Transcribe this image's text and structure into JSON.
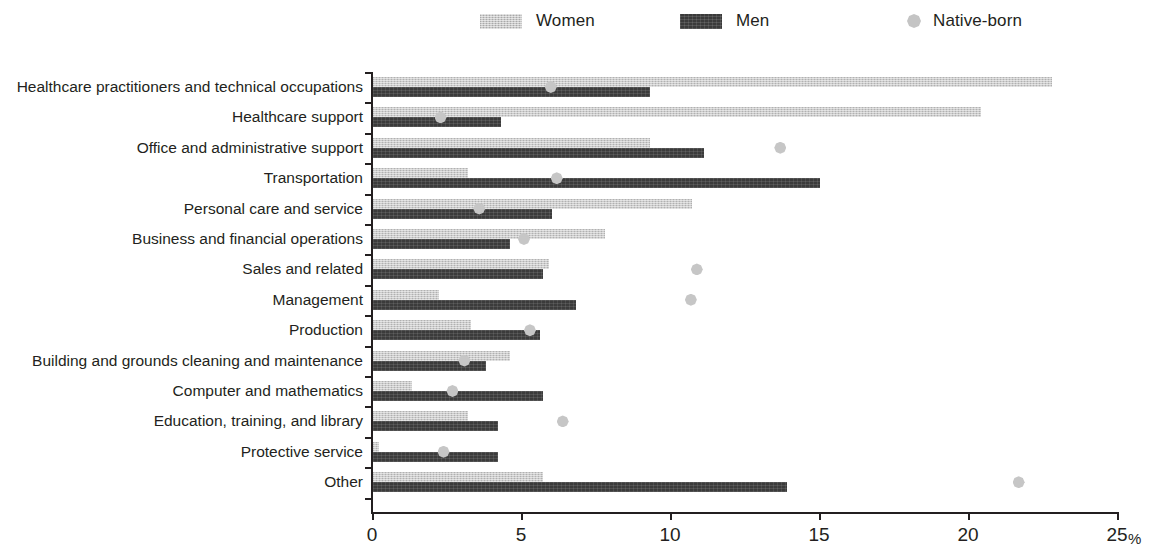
{
  "legend": {
    "items": [
      {
        "label": "Women",
        "key": "women",
        "color": "#c8c8c8"
      },
      {
        "label": "Men",
        "key": "men",
        "color": "#3a3a3a"
      },
      {
        "label": "Native-born",
        "key": "native",
        "color": "#c4c4c4"
      }
    ]
  },
  "axis": {
    "unit_label": "%",
    "xticks": [
      "0",
      "5",
      "10",
      "15",
      "20",
      "25"
    ]
  },
  "chart_data": {
    "type": "bar",
    "orientation": "horizontal",
    "title": "",
    "xlabel": "%",
    "ylabel": "",
    "xlim": [
      0,
      25
    ],
    "xticks": [
      0,
      5,
      10,
      15,
      20,
      25
    ],
    "grid": false,
    "legend_position": "top",
    "categories": [
      "Healthcare practitioners and technical occupations",
      "Healthcare support",
      "Office and administrative support",
      "Transportation",
      "Personal care and service",
      "Business and financial operations",
      "Sales and related",
      "Management",
      "Production",
      "Building and grounds cleaning and maintenance",
      "Computer and mathematics",
      "Education, training, and library",
      "Protective service",
      "Other"
    ],
    "series": [
      {
        "name": "Women",
        "type": "bar",
        "values": [
          22.8,
          20.4,
          9.3,
          3.2,
          10.7,
          7.8,
          5.9,
          2.2,
          3.3,
          4.6,
          1.3,
          3.2,
          0.2,
          5.7
        ]
      },
      {
        "name": "Men",
        "type": "bar",
        "values": [
          9.3,
          4.3,
          11.1,
          15.0,
          6.0,
          4.6,
          5.7,
          6.8,
          5.6,
          3.8,
          5.7,
          4.2,
          4.2,
          13.9
        ]
      },
      {
        "name": "Native-born",
        "type": "scatter",
        "values": [
          6.0,
          2.3,
          13.7,
          6.2,
          3.6,
          5.1,
          10.9,
          10.7,
          5.3,
          3.1,
          2.7,
          6.4,
          2.4,
          21.7
        ]
      }
    ]
  }
}
